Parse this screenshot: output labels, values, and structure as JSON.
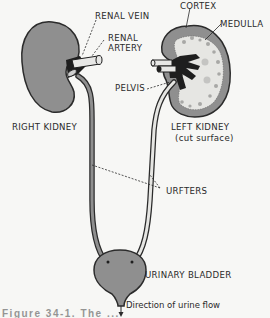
{
  "diagram": {
    "labels": {
      "renal_vein": "RENAL VEIN",
      "renal_artery_line1": "RENAL",
      "renal_artery_line2": "ARTERY",
      "cortex": "CORTEX",
      "medulla": "MEDULLA",
      "pelvis": "PELVIS",
      "right_kidney": "RIGHT KIDNEY",
      "left_kidney": "LEFT KIDNEY",
      "left_kidney_sub": "(cut surface)",
      "ureters": "URFTERS",
      "urinary_bladder": "URINARY BLADDER",
      "flow_direction": "Direction of urine flow"
    },
    "caption_partial": "Figure 34-1. The ...",
    "colors": {
      "organ_fill": "#8f8f8f",
      "outline": "#2b2b2b",
      "background": "#f7f7f5",
      "vessel_dark": "#1e1e1e",
      "vessel_light": "#e8e8e6"
    }
  }
}
